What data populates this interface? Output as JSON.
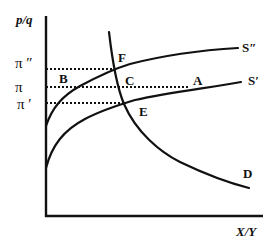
{
  "diagram": {
    "y_axis_label": "p/q",
    "x_axis_label": "X/Y",
    "price_levels": [
      {
        "id": "pi_double_prime",
        "label": "π ″"
      },
      {
        "id": "pi",
        "label": "π"
      },
      {
        "id": "pi_prime",
        "label": "π ′"
      }
    ],
    "curves": [
      {
        "id": "S_double_prime",
        "label": "S″",
        "type": "supply"
      },
      {
        "id": "S_prime",
        "label": "S′",
        "type": "supply"
      },
      {
        "id": "D",
        "label": "D",
        "type": "demand"
      }
    ],
    "points": [
      {
        "id": "F",
        "label": "F",
        "description": "intersection of D and S″ at π″"
      },
      {
        "id": "C",
        "label": "C",
        "description": "D at π"
      },
      {
        "id": "E",
        "label": "E",
        "description": "intersection of D and S′ at π′"
      },
      {
        "id": "B",
        "label": "B",
        "description": "S″ at π"
      },
      {
        "id": "A",
        "label": "A",
        "description": "S′ at π"
      }
    ]
  }
}
